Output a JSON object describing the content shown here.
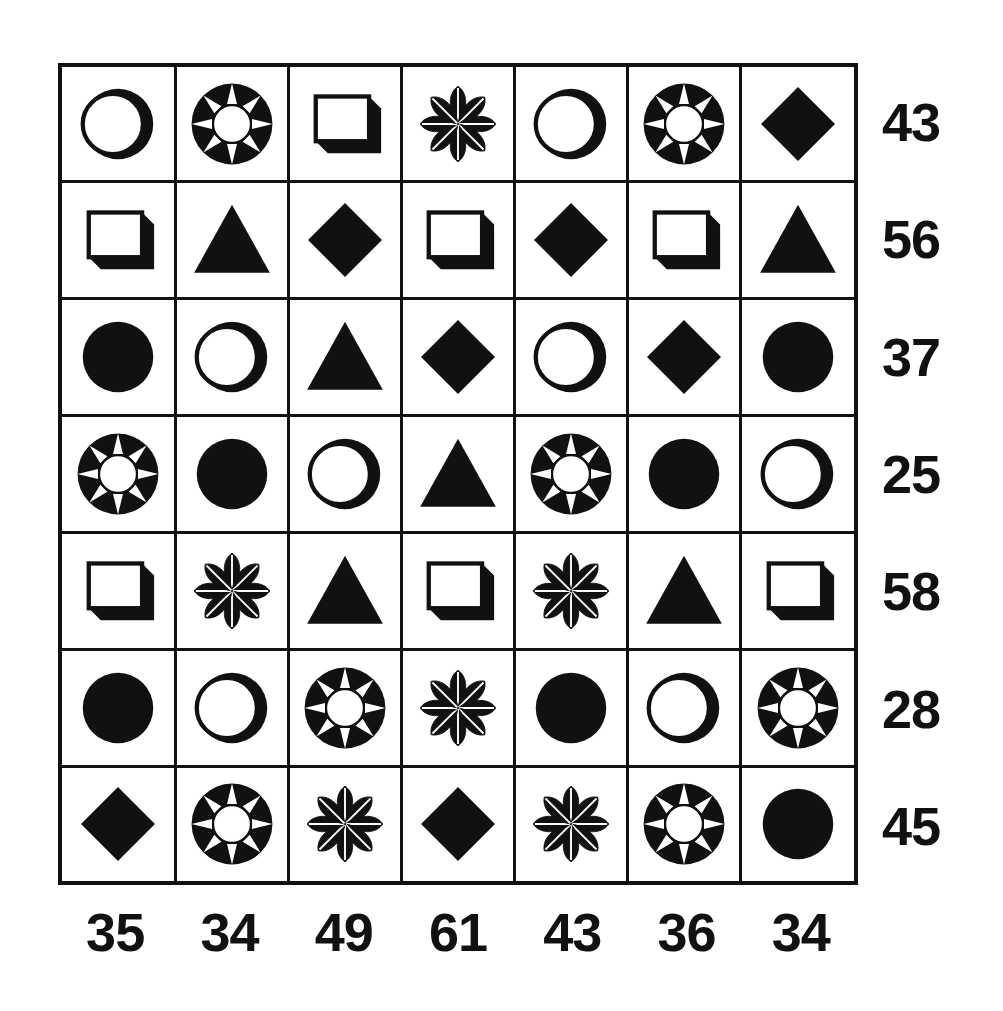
{
  "puzzle": {
    "title": "Shape Sum Grid",
    "ink_color": "#111111",
    "background_color": "#ffffff",
    "rows": 7,
    "columns": 7,
    "shape_legend": {
      "ring": "ring-circle-shape",
      "circle": "filled-circle-shape",
      "sun": "sun-burst-shape",
      "square": "shadowed-square-shape",
      "flower": "eight-petal-flower-shape",
      "diamond": "filled-diamond-shape",
      "triangle": "filled-triangle-shape"
    },
    "grid": [
      [
        "ring",
        "sun",
        "square",
        "flower",
        "ring",
        "sun",
        "diamond"
      ],
      [
        "square",
        "triangle",
        "diamond",
        "square",
        "diamond",
        "square",
        "triangle"
      ],
      [
        "circle",
        "ring",
        "triangle",
        "diamond",
        "ring",
        "diamond",
        "circle"
      ],
      [
        "sun",
        "circle",
        "ring",
        "triangle",
        "sun",
        "circle",
        "ring"
      ],
      [
        "square",
        "flower",
        "triangle",
        "square",
        "flower",
        "triangle",
        "square"
      ],
      [
        "circle",
        "ring",
        "sun",
        "flower",
        "circle",
        "ring",
        "sun"
      ],
      [
        "diamond",
        "sun",
        "flower",
        "diamond",
        "flower",
        "sun",
        "circle"
      ]
    ],
    "row_totals": [
      "43",
      "56",
      "37",
      "25",
      "58",
      "28",
      "45"
    ],
    "column_totals": [
      "35",
      "34",
      "49",
      "61",
      "43",
      "36",
      "34"
    ]
  },
  "chart_data": {
    "type": "table",
    "categories": [
      "C1",
      "C2",
      "C3",
      "C4",
      "C5",
      "C6",
      "C7"
    ],
    "row_labels": [
      "R1",
      "R2",
      "R3",
      "R4",
      "R5",
      "R6",
      "R7"
    ],
    "cells": [
      [
        "ring",
        "sun",
        "square",
        "flower",
        "ring",
        "sun",
        "diamond"
      ],
      [
        "square",
        "triangle",
        "diamond",
        "square",
        "diamond",
        "square",
        "triangle"
      ],
      [
        "circle",
        "ring",
        "triangle",
        "diamond",
        "ring",
        "diamond",
        "circle"
      ],
      [
        "sun",
        "circle",
        "ring",
        "triangle",
        "sun",
        "circle",
        "ring"
      ],
      [
        "square",
        "flower",
        "triangle",
        "square",
        "flower",
        "triangle",
        "square"
      ],
      [
        "circle",
        "ring",
        "sun",
        "flower",
        "circle",
        "ring",
        "sun"
      ],
      [
        "diamond",
        "sun",
        "flower",
        "diamond",
        "flower",
        "sun",
        "circle"
      ]
    ],
    "row_sums": [
      43,
      56,
      37,
      25,
      58,
      28,
      45
    ],
    "column_sums": [
      35,
      34,
      49,
      61,
      43,
      36,
      34
    ],
    "grid": true,
    "legend": "none"
  }
}
